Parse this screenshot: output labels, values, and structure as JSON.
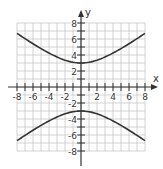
{
  "chart_data": {
    "type": "line",
    "title": "",
    "xlabel": "x",
    "ylabel": "y",
    "xlim": [
      -8,
      8
    ],
    "ylim": [
      -8,
      8
    ],
    "grid": true,
    "grid_step": 1,
    "x_ticks": [
      "-8",
      "-6",
      "-4",
      "-2",
      "2",
      "4",
      "6",
      "8"
    ],
    "y_ticks": [
      "8",
      "6",
      "4",
      "2",
      "-2",
      "-4",
      "-6",
      "-8"
    ],
    "equation": "y^2/9 - x^2/16 = 1",
    "series": [
      {
        "name": "upper branch",
        "x": [
          -8,
          -6,
          -4,
          -2,
          0,
          2,
          4,
          6,
          8
        ],
        "y": [
          6.7,
          5.4,
          4.2,
          3.4,
          3.0,
          3.4,
          4.2,
          5.4,
          6.7
        ]
      },
      {
        "name": "lower branch",
        "x": [
          -8,
          -6,
          -4,
          -2,
          0,
          2,
          4,
          6,
          8
        ],
        "y": [
          -6.7,
          -5.4,
          -4.2,
          -3.4,
          -3.0,
          -3.4,
          -4.2,
          -5.4,
          -6.7
        ]
      }
    ],
    "colors": {
      "grid": "#c8c8c8",
      "axis": "#333333",
      "curve": "#333333"
    }
  }
}
